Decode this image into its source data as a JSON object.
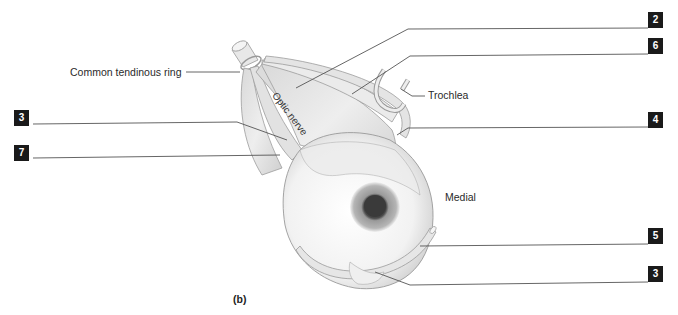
{
  "figure": {
    "caption": "(b)",
    "text_labels": {
      "common_tendinous_ring": "Common tendinous ring",
      "trochlea": "Trochlea",
      "optic_nerve": "Optic nerve",
      "medial": "Medial"
    },
    "number_labels": [
      {
        "id": "label-2",
        "value": "2",
        "side": "right"
      },
      {
        "id": "label-6",
        "value": "6",
        "side": "right"
      },
      {
        "id": "label-3-left",
        "value": "3",
        "side": "left"
      },
      {
        "id": "label-4",
        "value": "4",
        "side": "right"
      },
      {
        "id": "label-7",
        "value": "7",
        "side": "left"
      },
      {
        "id": "label-5",
        "value": "5",
        "side": "right"
      },
      {
        "id": "label-3-right",
        "value": "3",
        "side": "right"
      }
    ],
    "colors": {
      "label_box": "#1a1a1a",
      "leader_line": "#555555",
      "muscle_fill": "#e6e6e6",
      "eyeball_fill": "#f4f4f4",
      "iris": "#8a8a8a",
      "pupil": "#3a3a3a"
    }
  }
}
